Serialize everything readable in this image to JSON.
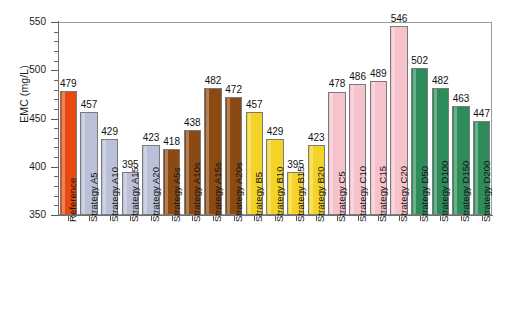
{
  "chart_data": {
    "type": "bar",
    "title": "",
    "subtitle": "",
    "xlabel": "",
    "ylabel": "EMC (mg/L)",
    "ylim": [
      350,
      550
    ],
    "ytick_labels": [
      "350",
      "400",
      "450",
      "500",
      "550"
    ],
    "ytick_values": [
      350,
      400,
      450,
      500,
      550
    ],
    "minor_tick_step": 10,
    "grid": false,
    "legend": null,
    "categories": [
      "Reference",
      "Strategy A5",
      "Strategy A10",
      "Strategy A15",
      "Strategy A20",
      "Strategy A5s",
      "Strategy A10s",
      "Strategy A15s",
      "Strategy A20s",
      "Strategy B5",
      "Strategy B10",
      "Strategy B15",
      "Strategy B20",
      "Strategy C5",
      "Strategy C10",
      "Strategy C15",
      "Strategy C20",
      "Strategy D50",
      "Strategy D100",
      "Strategy D150",
      "Strategy D200"
    ],
    "values": [
      479,
      457,
      429,
      395,
      423,
      418,
      438,
      482,
      472,
      457,
      429,
      395,
      423,
      478,
      486,
      489,
      546,
      502,
      482,
      463,
      447
    ],
    "bar_colors": [
      "#E8490F",
      "#B9C0D8",
      "#B9C0D8",
      "#B9C0D8",
      "#B9C0D8",
      "#8B4A12",
      "#8B4A12",
      "#8B4A12",
      "#8B4A12",
      "#F4D327",
      "#F4D327",
      "#F4D327",
      "#F4D327",
      "#F6C3CC",
      "#F6C3CC",
      "#F6C3CC",
      "#F6C3CC",
      "#2E8B5A",
      "#2E8B5A",
      "#2E8B5A",
      "#2E8B5A"
    ],
    "group_names": [
      "Reference",
      "Strategy A",
      "Strategy As",
      "Strategy B",
      "Strategy C",
      "Strategy D"
    ],
    "colors": {
      "reference": "#E8490F",
      "strategy_a": "#B9C0D8",
      "strategy_as": "#8B4A12",
      "strategy_b": "#F4D327",
      "strategy_c": "#F6C3CC",
      "strategy_d": "#2E8B5A",
      "axis": "#6f6f6f",
      "text": "#141414"
    }
  }
}
